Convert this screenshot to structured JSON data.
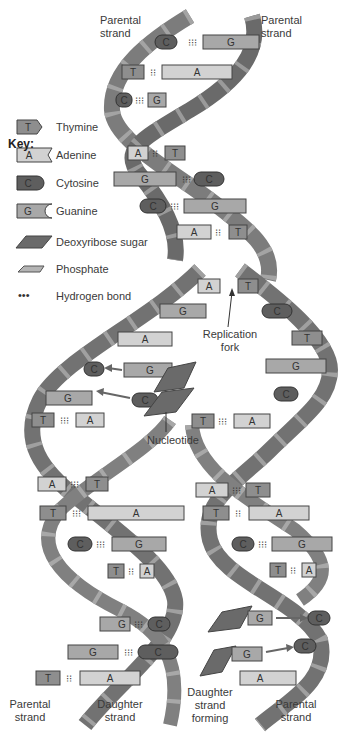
{
  "labels": {
    "top_left": "Parental\nstrand",
    "top_right": "Parental\nstrand",
    "replication_fork": "Replication\nfork",
    "nucleotide": "Nucleotide",
    "bottom": [
      {
        "text": "Parental\nstrand"
      },
      {
        "text": "Daughter\nstrand"
      },
      {
        "text": "Daughter\nstrand\nforming"
      },
      {
        "text": "Parental\nstrand"
      }
    ]
  },
  "key": {
    "title": "Key:",
    "items": [
      {
        "symbol": "T",
        "label": "Thymine"
      },
      {
        "symbol": "A",
        "label": "Adenine"
      },
      {
        "symbol": "C",
        "label": "Cytosine"
      },
      {
        "symbol": "G",
        "label": "Guanine"
      },
      {
        "symbol": "sugar",
        "label": "Deoxyribose sugar"
      },
      {
        "symbol": "phosphate",
        "label": "Phosphate"
      },
      {
        "symbol": "...",
        "label": "Hydrogen bond"
      }
    ]
  },
  "colors": {
    "thymine": "#8e8e8e",
    "adenine": "#d2d2d2",
    "cytosine": "#5e5e5e",
    "guanine": "#a8a8a8",
    "sugar": "#6a6a6a",
    "phosphate": "#b4b4b4",
    "strand_dark": "#6f6f6f",
    "strand_light": "#8d8d8d"
  },
  "base_pairs_top": [
    {
      "left": "C",
      "right": "G"
    },
    {
      "left": "T",
      "right": "A"
    },
    {
      "left": "C",
      "right": "G"
    },
    {
      "left": "A",
      "right": "T"
    },
    {
      "left": "G",
      "right": "C"
    },
    {
      "left": "C",
      "right": "G"
    },
    {
      "left": "A",
      "right": "T"
    }
  ],
  "fork_unpaired_left": [
    "A",
    "G",
    "A",
    "C",
    "G",
    "T"
  ],
  "fork_unpaired_right": [
    "T",
    "C",
    "T",
    "G",
    "C"
  ],
  "base_pairs_left_daughter": [
    {
      "left": "A",
      "right": "T"
    },
    {
      "left": "T",
      "right": "A"
    },
    {
      "left": "C",
      "right": "G"
    },
    {
      "left": "T",
      "right": "A"
    },
    {
      "left": "G",
      "right": "C"
    },
    {
      "left": "G",
      "right": "C"
    },
    {
      "left": "T",
      "right": "A"
    }
  ],
  "base_pairs_right_daughter": [
    {
      "left": "T",
      "right": "A"
    },
    {
      "left": "A",
      "right": "T"
    },
    {
      "left": "T",
      "right": "A"
    },
    {
      "left": "C",
      "right": "G"
    },
    {
      "left": "T",
      "right": "A"
    }
  ],
  "incoming_nucleotides": [
    "G",
    "C",
    "G",
    "G"
  ]
}
